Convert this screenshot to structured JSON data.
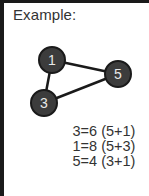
{
  "title": "Example:",
  "graph": {
    "nodes": [
      {
        "id": "1",
        "label": "1",
        "cx": 52,
        "cy": 60
      },
      {
        "id": "5",
        "label": "5",
        "cx": 118,
        "cy": 74
      },
      {
        "id": "3",
        "label": "3",
        "cx": 44,
        "cy": 103
      }
    ],
    "edges": [
      {
        "from": "1",
        "to": "5"
      },
      {
        "from": "1",
        "to": "3"
      },
      {
        "from": "3",
        "to": "5"
      }
    ],
    "node_radius": 13,
    "node_fill": "#3c3c3c",
    "node_stroke": "#1a1a1a",
    "label_color": "#e8e8e8",
    "edge_color": "#1a1a1a"
  },
  "equations": [
    "3=6 (5+1)",
    "1=8 (5+3)",
    "5=4 (3+1)"
  ]
}
